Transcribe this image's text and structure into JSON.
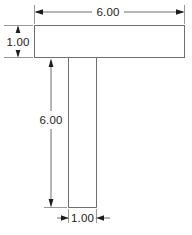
{
  "drawing": {
    "title": "T-shaped part dimensioned orthographic view",
    "units_implied": "inches",
    "colors": {
      "background": "#ffffff",
      "outline": "#6e6e6e",
      "dimension_line": "#5f5f5f",
      "extension_line": "#8d8d8d",
      "arrow": "#1c1c1c",
      "text": "#1c1c1c"
    },
    "shape": {
      "name": "T-shape",
      "flange": {
        "x": 34,
        "y": 25,
        "width": 151,
        "height": 33
      },
      "web": {
        "x": 68,
        "y": 58,
        "width": 29,
        "height": 150
      }
    },
    "dimensions": {
      "top_width": {
        "label": "6.00",
        "orientation": "horizontal",
        "arrow_style": "outward",
        "line_y": 12,
        "from_x": 34,
        "to_x": 185
      },
      "left_thickness": {
        "label": "1.00",
        "orientation": "vertical",
        "arrow_style": "outward",
        "line_x": 18,
        "from_y": 25,
        "to_y": 58
      },
      "stem_height": {
        "label": "6.00",
        "orientation": "vertical",
        "arrow_style": "inward",
        "line_x": 51,
        "from_y": 60,
        "to_y": 206
      },
      "stem_width": {
        "label": "1.00",
        "orientation": "horizontal",
        "arrow_style": "inward",
        "line_y": 218,
        "from_x": 68,
        "to_x": 97
      }
    }
  }
}
